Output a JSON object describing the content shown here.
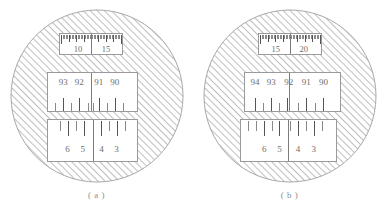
{
  "figure": {
    "type": "diagram",
    "background_color": "#ffffff",
    "hatch_color": "#9e9e9e",
    "line_color": "#8a8a8a",
    "text_color": "#6d6d6d"
  },
  "panels": [
    {
      "id": "a",
      "caption": "( a )",
      "scales": [
        {
          "name": "top-fine-scale",
          "labels": [
            "10",
            "15"
          ],
          "label_positions": [
            0.29,
            0.74
          ],
          "divider_positions": [
            0.5
          ],
          "fine_ticks": 41,
          "tick_side": "top"
        },
        {
          "name": "middle-scale",
          "labels": [
            "93",
            "92",
            "91",
            "90"
          ],
          "label_positions": [
            0.17,
            0.35,
            0.57,
            0.75
          ],
          "divider_positions": [
            0.48
          ],
          "major_ticks": [
            0.08,
            0.17,
            0.26,
            0.35,
            0.455,
            0.5,
            0.575,
            0.665,
            0.755,
            0.845
          ],
          "tick_side": "bottom"
        },
        {
          "name": "bottom-scale",
          "labels": [
            "6",
            "5",
            "4",
            "3"
          ],
          "label_positions": [
            0.22,
            0.39,
            0.6,
            0.77
          ],
          "divider_positions": [
            0.5
          ],
          "major_ticks": [
            0.13,
            0.225,
            0.315,
            0.405,
            0.5,
            0.59,
            0.685,
            0.775,
            0.865
          ],
          "tick_side": "top"
        }
      ]
    },
    {
      "id": "b",
      "caption": "( b )",
      "scales": [
        {
          "name": "top-fine-scale",
          "labels": [
            "15",
            "20"
          ],
          "label_positions": [
            0.27,
            0.72
          ],
          "divider_positions": [
            0.5
          ],
          "fine_ticks": 41,
          "tick_side": "top"
        },
        {
          "name": "middle-scale",
          "labels": [
            "94",
            "93",
            "92",
            "91",
            "90"
          ],
          "label_positions": [
            0.105,
            0.275,
            0.46,
            0.645,
            0.825
          ],
          "divider_positions": [
            0.465
          ],
          "major_ticks": [
            0.105,
            0.19,
            0.275,
            0.36,
            0.445,
            0.465,
            0.555,
            0.645,
            0.735,
            0.825
          ],
          "tick_side": "bottom"
        },
        {
          "name": "bottom-scale",
          "labels": [
            "6",
            "5",
            "4",
            "3"
          ],
          "label_positions": [
            0.245,
            0.405,
            0.6,
            0.765
          ],
          "divider_positions": [
            0.495
          ],
          "major_ticks": [
            0.075,
            0.155,
            0.245,
            0.325,
            0.405,
            0.495,
            0.515,
            0.6,
            0.685,
            0.765,
            0.855
          ],
          "tick_side": "top"
        }
      ]
    }
  ]
}
